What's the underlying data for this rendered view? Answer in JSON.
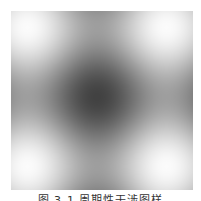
{
  "figure": {
    "grid": {
      "bright_spots_x": 3,
      "bright_spots_y": 3
    },
    "colors": {
      "bright": "#ffffff",
      "dark": "#2a2a2a"
    }
  },
  "caption": {
    "text": "图 3-1  周期性干涉图样"
  }
}
